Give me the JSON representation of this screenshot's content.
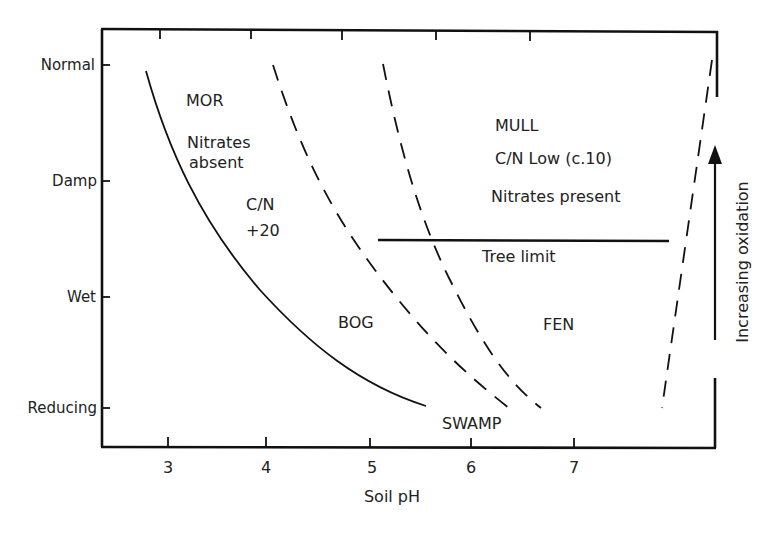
{
  "diagram": {
    "title": "",
    "x_axis": {
      "title": "Soil pH",
      "ticks": [
        "3",
        "4",
        "5",
        "6",
        "7"
      ]
    },
    "y_axis": {
      "ticks": [
        "Normal",
        "Damp",
        "Wet",
        "Reducing"
      ]
    },
    "regions": {
      "mor": "MOR",
      "nitrates_absent_1": "Nitrates",
      "nitrates_absent_2": "absent",
      "cn_high_1": "C/N",
      "cn_high_2": "+20",
      "mull": "MULL",
      "cn_low": "C/N Low (c.10)",
      "nitrates_present": "Nitrates present",
      "tree_limit": "Tree limit",
      "bog": "BOG",
      "fen": "FEN",
      "swamp": "SWAMP"
    },
    "side_annotation": "Increasing oxidation",
    "lines": [
      {
        "name": "mor-boundary",
        "style": "solid"
      },
      {
        "name": "bog-boundary",
        "style": "dashed"
      },
      {
        "name": "fen-boundary",
        "style": "dashed"
      },
      {
        "name": "upper-ph-boundary",
        "style": "dashed"
      },
      {
        "name": "tree-limit",
        "style": "solid"
      }
    ],
    "colors": {
      "ink": "#111111",
      "background": "#ffffff"
    }
  }
}
